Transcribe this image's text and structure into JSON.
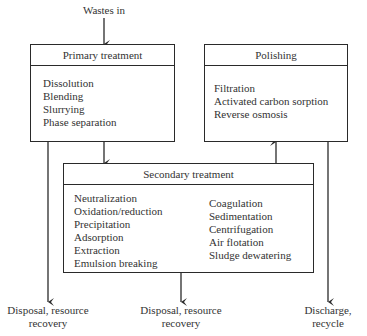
{
  "input_label": "Wastes in",
  "primary": {
    "title": "Primary treatment",
    "items": [
      "Dissolution",
      "Blending",
      "Slurrying",
      "Phase separation"
    ]
  },
  "polishing": {
    "title": "Polishing",
    "items": [
      "Filtration",
      "Activated carbon sorption",
      "Reverse osmosis"
    ]
  },
  "secondary": {
    "title": "Secondary treatment",
    "items_left": [
      "Neutralization",
      "Oxidation/reduction",
      "Precipitation",
      "Adsorption",
      "Extraction",
      "Emulsion breaking"
    ],
    "items_right": [
      "Coagulation",
      "Sedimentation",
      "Centrifugation",
      "Air flotation",
      "Sludge dewatering"
    ]
  },
  "outputs": {
    "left": [
      "Disposal, resource",
      "recovery"
    ],
    "center": [
      "Disposal, resource",
      "recovery"
    ],
    "right": [
      "Discharge,",
      "recycle"
    ]
  },
  "colors": {
    "line": "#2a2a2a",
    "text": "#333333"
  }
}
